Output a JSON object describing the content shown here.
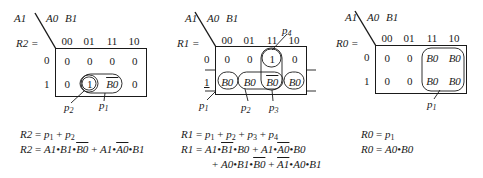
{
  "maps": [
    {
      "id": "R2",
      "corner": {
        "row_var": "A1",
        "col_vars": "A0  B1"
      },
      "output_label": "R2 =",
      "col_headers": [
        "00",
        "01",
        "11",
        "10"
      ],
      "row_headers": [
        "0",
        "1"
      ],
      "cells": [
        [
          "0",
          "0",
          "0",
          "0"
        ],
        [
          "0",
          "1",
          "B0",
          "0"
        ]
      ],
      "cell_overbar": [
        [
          false,
          false,
          false,
          false
        ],
        [
          false,
          false,
          true,
          false
        ]
      ],
      "groups": [
        {
          "name": "p1",
          "cells": [
            [
              1,
              2
            ]
          ],
          "label": "p1"
        },
        {
          "name": "p2",
          "cells": [
            [
              1,
              1
            ]
          ],
          "label": "p2"
        }
      ],
      "labels": [
        "p2",
        "p1"
      ],
      "equations": [
        "R2 = p1 + p2",
        "R2 = A1•B1•B0̅ + A1•A0̅•B1"
      ]
    },
    {
      "id": "R1",
      "corner": {
        "row_var": "A1",
        "col_vars": "A0  B1"
      },
      "output_label": "R1 =",
      "col_headers": [
        "00",
        "01",
        "11",
        "10"
      ],
      "row_headers": [
        "0",
        "1"
      ],
      "cells": [
        [
          "0",
          "0",
          "1",
          "0"
        ],
        [
          "B0",
          "B0",
          "B0",
          "B0"
        ]
      ],
      "cell_overbar": [
        [
          false,
          false,
          false,
          false
        ],
        [
          false,
          false,
          true,
          false
        ]
      ],
      "groups": [
        {
          "name": "p1",
          "label": "p1"
        },
        {
          "name": "p2",
          "label": "p2"
        },
        {
          "name": "p3",
          "label": "p3"
        },
        {
          "name": "p4",
          "label": "p4"
        }
      ],
      "labels": [
        "p1",
        "p2",
        "p3",
        "p4"
      ],
      "equations": [
        "R1 = p1 + p2 + p3 + p4",
        "R1 = A1•B1̅•B0 + A1•A0̅•B0",
        "+ A0•B1•B0̅ + A1̅•A0•B1"
      ]
    },
    {
      "id": "R0",
      "corner": {
        "row_var": "A1",
        "col_vars": "A0  B1"
      },
      "output_label": "R0 =",
      "col_headers": [
        "00",
        "01",
        "11",
        "10"
      ],
      "row_headers": [
        "0",
        "1"
      ],
      "cells": [
        [
          "0",
          "0",
          "B0",
          "B0"
        ],
        [
          "0",
          "0",
          "B0",
          "B0"
        ]
      ],
      "groups": [
        {
          "name": "p1",
          "label": "p1"
        }
      ],
      "labels": [
        "p1"
      ],
      "equations": [
        "R0 = p1",
        "R0 = A0•B0"
      ]
    }
  ],
  "text": {
    "r2_eq1_lhs": "R2",
    "r2_eq1_rhs_a": "p",
    "r2_eq1_rhs_a_sub": "1",
    "r2_eq1_plus": "+",
    "r2_eq1_rhs_b": "p",
    "r2_eq1_rhs_b_sub": "2",
    "r1_eq1_lhs": "R1",
    "r0_eq1_lhs": "R0",
    "eq_sign": "=",
    "A1": "A1",
    "A0": "A0",
    "B1": "B1",
    "B0": "B0",
    "dot": "•",
    "p": "p",
    "s1": "1",
    "s2": "2",
    "s3": "3",
    "s4": "4",
    "plus": "+"
  }
}
